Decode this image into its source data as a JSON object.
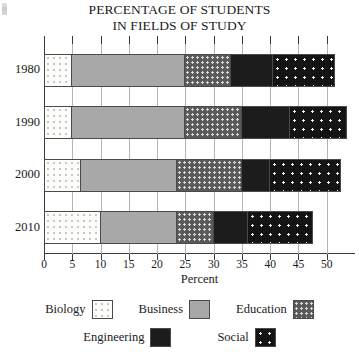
{
  "chart_data": {
    "type": "bar",
    "orientation": "horizontal",
    "stacked": true,
    "title": "PERCENTAGE OF STUDENTS IN FIELDS OF STUDY",
    "title_lines": [
      "PERCENTAGE OF STUDENTS",
      "IN FIELDS OF STUDY"
    ],
    "xlabel": "Percent",
    "ylabel": "",
    "categories": [
      "1980",
      "1990",
      "2000",
      "2010"
    ],
    "series": [
      {
        "name": "Biology",
        "values": [
          5,
          5,
          6.5,
          10
        ]
      },
      {
        "name": "Business",
        "values": [
          20,
          20,
          17,
          13.5
        ]
      },
      {
        "name": "Education",
        "values": [
          8,
          10,
          11.5,
          6.5
        ]
      },
      {
        "name": "Engineering",
        "values": [
          7.5,
          8.5,
          5,
          6
        ]
      },
      {
        "name": "Social",
        "values": [
          11,
          10,
          12.5,
          11.5
        ]
      }
    ],
    "cumulative_ends": {
      "1980": [
        5,
        25,
        33,
        40.5,
        51.5
      ],
      "1990": [
        5,
        25,
        35,
        43.5,
        53.5
      ],
      "2000": [
        6.5,
        23.5,
        35,
        40,
        52.5
      ],
      "2010": [
        10,
        23.5,
        30,
        36,
        47.5
      ]
    },
    "totals": [
      51.5,
      53.5,
      52.5,
      47.5
    ],
    "xlim": [
      0,
      55
    ],
    "xticks": [
      0,
      5,
      10,
      15,
      20,
      25,
      30,
      35,
      40,
      45,
      50
    ],
    "xtick_labels": [
      "0",
      "5",
      "10",
      "15",
      "20",
      "25",
      "30",
      "35",
      "40",
      "45",
      "50"
    ],
    "grid": "vertical",
    "legend_position": "bottom",
    "legend_rows": [
      [
        "Biology",
        "Business",
        "Education"
      ],
      [
        "Engineering",
        "Social"
      ]
    ],
    "colors": {
      "Biology": "#fdfdfb",
      "Business": "#a8a8a8",
      "Education": "#5a5a5a",
      "Engineering": "#1c1c1c",
      "Social": "#141414",
      "axis": "#3a3a3a",
      "gridline": "#b4b4b4"
    },
    "patterns": {
      "Biology": "light-dotted",
      "Business": "solid-gray",
      "Education": "dark-checkered",
      "Engineering": "solid-black",
      "Social": "black-white-dots"
    }
  }
}
